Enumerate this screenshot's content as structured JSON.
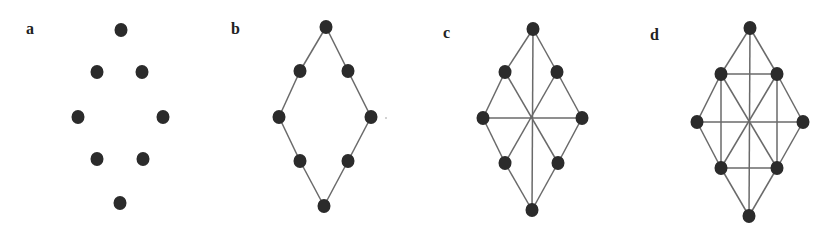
{
  "figure": {
    "colors": {
      "node": "#2b2b2b",
      "edge": "#6a6a6a",
      "label": "#222222",
      "background": "#ffffff"
    },
    "node_radius": {
      "rx": 6.5,
      "ry": 7
    },
    "panels": [
      {
        "id": "a",
        "label": "a",
        "label_pos": [
          26,
          34
        ],
        "nodes": [
          [
            121,
            30
          ],
          [
            97,
            72
          ],
          [
            142,
            72
          ],
          [
            78,
            117
          ],
          [
            163,
            117
          ],
          [
            97,
            159
          ],
          [
            143,
            159
          ],
          [
            120,
            203
          ]
        ],
        "edges": []
      },
      {
        "id": "b",
        "label": "b",
        "label_pos": [
          231,
          34
        ],
        "nodes": [
          [
            326,
            27
          ],
          [
            300,
            71
          ],
          [
            348,
            71
          ],
          [
            279,
            117
          ],
          [
            371,
            117
          ],
          [
            300,
            161
          ],
          [
            348,
            161
          ],
          [
            324,
            206
          ]
        ],
        "edges": [
          [
            0,
            1
          ],
          [
            1,
            3
          ],
          [
            3,
            5
          ],
          [
            5,
            7
          ],
          [
            0,
            2
          ],
          [
            2,
            4
          ],
          [
            4,
            6
          ],
          [
            6,
            7
          ]
        ]
      },
      {
        "id": "c",
        "label": "c",
        "label_pos": [
          443,
          38
        ],
        "nodes": [
          [
            533,
            29
          ],
          [
            505,
            72
          ],
          [
            557,
            72
          ],
          [
            483,
            118
          ],
          [
            582,
            118
          ],
          [
            505,
            163
          ],
          [
            558,
            163
          ],
          [
            532,
            210
          ]
        ],
        "edges": [
          [
            0,
            1
          ],
          [
            1,
            3
          ],
          [
            3,
            5
          ],
          [
            5,
            7
          ],
          [
            0,
            2
          ],
          [
            2,
            4
          ],
          [
            4,
            6
          ],
          [
            6,
            7
          ],
          [
            0,
            7
          ],
          [
            3,
            4
          ],
          [
            1,
            6
          ],
          [
            2,
            5
          ]
        ]
      },
      {
        "id": "d",
        "label": "d",
        "label_pos": [
          650,
          40
        ],
        "nodes": [
          [
            750,
            28
          ],
          [
            721,
            74
          ],
          [
            777,
            74
          ],
          [
            697,
            122
          ],
          [
            803,
            122
          ],
          [
            721,
            168
          ],
          [
            777,
            168
          ],
          [
            749,
            216
          ]
        ],
        "edges": [
          [
            0,
            1
          ],
          [
            1,
            3
          ],
          [
            3,
            5
          ],
          [
            5,
            7
          ],
          [
            0,
            2
          ],
          [
            2,
            4
          ],
          [
            4,
            6
          ],
          [
            6,
            7
          ],
          [
            0,
            7
          ],
          [
            3,
            4
          ],
          [
            1,
            6
          ],
          [
            2,
            5
          ],
          [
            1,
            2
          ],
          [
            5,
            6
          ],
          [
            1,
            5
          ],
          [
            2,
            6
          ]
        ]
      }
    ]
  }
}
